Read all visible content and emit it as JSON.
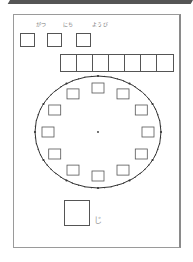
{
  "header": {
    "banner_text": ""
  },
  "date_labels": {
    "month": "がつ",
    "day": "にち",
    "weekday": "ようび"
  },
  "date_boxes": 3,
  "answer_row_cells": 7,
  "clock": {
    "hour_boxes": 12,
    "center": [
      98,
      132
    ],
    "radius_x": 63,
    "radius_y": 56
  },
  "time_answer": {
    "suffix": "じ"
  },
  "colors": {
    "line": "#555555",
    "frame": "#9a9a9a",
    "label": "#777777",
    "banner": "#555555"
  }
}
